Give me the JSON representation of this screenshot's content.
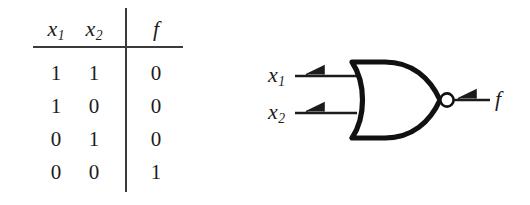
{
  "figure": {
    "kind": "logic-gate-figure",
    "gate_type": "NOR",
    "background_color": "#ffffff",
    "ink_color": "#1c1c1c",
    "rule_color": "#3b3b3b"
  },
  "truth_table": {
    "headers": [
      "x",
      "f"
    ],
    "header_cells": [
      {
        "base": "x",
        "sub": "1"
      },
      {
        "base": "x",
        "sub": "2"
      },
      {
        "base": "f",
        "sub": ""
      }
    ],
    "rows": [
      {
        "x1": "1",
        "x2": "1",
        "f": "0"
      },
      {
        "x1": "1",
        "x2": "0",
        "f": "0"
      },
      {
        "x1": "0",
        "x2": "1",
        "f": "0"
      },
      {
        "x1": "0",
        "x2": "0",
        "f": "1"
      }
    ]
  },
  "gate": {
    "inputs": [
      {
        "base": "x",
        "sub": "1"
      },
      {
        "base": "x",
        "sub": "2"
      }
    ],
    "output": {
      "base": "f",
      "sub": ""
    },
    "bubble": "inversion-bubble",
    "input_markers": "flag-arrow",
    "output_marker": "flag-arrow"
  }
}
